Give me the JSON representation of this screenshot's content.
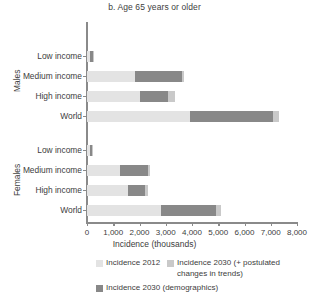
{
  "chart_data": {
    "type": "bar",
    "orientation": "horizontal",
    "stacked": true,
    "title": "b. Age 65 years or older",
    "xlabel": "Incidence (thousands)",
    "ylabel": "",
    "xlim": [
      0,
      8000
    ],
    "xticks": [
      0,
      1000,
      2000,
      3000,
      4000,
      5000,
      6000,
      7000,
      8000
    ],
    "xtick_labels": [
      "0",
      "1,000",
      "2,000",
      "3,000",
      "4,000",
      "5,000",
      "6,000",
      "7,000",
      "8,000"
    ],
    "grid": false,
    "legend_position": "bottom",
    "groups": [
      {
        "name": "Males",
        "categories": [
          "Low income",
          "Medium income",
          "High income",
          "World"
        ]
      },
      {
        "name": "Females",
        "categories": [
          "Low income",
          "Medium income",
          "High income",
          "World"
        ]
      }
    ],
    "series": [
      {
        "name": "Incidence 2012",
        "color": "#e3e3e3",
        "values": [
          120,
          1830,
          2020,
          3930,
          100,
          1250,
          1560,
          2810
        ]
      },
      {
        "name": "Incidence 2030 (demographics)",
        "color": "#888888",
        "values": [
          110,
          1800,
          1060,
          3140,
          80,
          1060,
          650,
          2090
        ]
      },
      {
        "name": "Incidence 2030 (+ postulated changes in trends)",
        "color": "#c9c9c9",
        "values": [
          20,
          60,
          280,
          230,
          15,
          90,
          130,
          190
        ]
      }
    ],
    "bars": [
      {
        "group": "Males",
        "category": "Low income",
        "incidence_2012": 120,
        "incidence_2030_demographics": 110,
        "incidence_2030_postulated": 20,
        "total": 250
      },
      {
        "group": "Males",
        "category": "Medium income",
        "incidence_2012": 1830,
        "incidence_2030_demographics": 1800,
        "incidence_2030_postulated": 60,
        "total": 3690
      },
      {
        "group": "Males",
        "category": "High income",
        "incidence_2012": 2020,
        "incidence_2030_demographics": 1060,
        "incidence_2030_postulated": 280,
        "total": 3360
      },
      {
        "group": "Males",
        "category": "World",
        "incidence_2012": 3930,
        "incidence_2030_demographics": 3140,
        "incidence_2030_postulated": 230,
        "total": 7300
      },
      {
        "group": "Females",
        "category": "Low income",
        "incidence_2012": 100,
        "incidence_2030_demographics": 80,
        "incidence_2030_postulated": 15,
        "total": 195
      },
      {
        "group": "Females",
        "category": "Medium income",
        "incidence_2012": 1250,
        "incidence_2030_demographics": 1060,
        "incidence_2030_postulated": 90,
        "total": 2400
      },
      {
        "group": "Females",
        "category": "High income",
        "incidence_2012": 1560,
        "incidence_2030_demographics": 650,
        "incidence_2030_postulated": 130,
        "total": 2340
      },
      {
        "group": "Females",
        "category": "World",
        "incidence_2012": 2810,
        "incidence_2030_demographics": 2090,
        "incidence_2030_postulated": 190,
        "total": 5090
      }
    ]
  },
  "title": "b. Age 65 years or older",
  "axes": {
    "x_title": "Incidence (thousands)",
    "tick_labels": [
      "0",
      "1,000",
      "2,000",
      "3,000",
      "4,000",
      "5,000",
      "6,000",
      "7,000",
      "8,000"
    ]
  },
  "groups": {
    "males": "Males",
    "females": "Females"
  },
  "categories": {
    "low": "Low income",
    "medium": "Medium income",
    "high": "High income",
    "world": "World"
  },
  "legend": {
    "item_2012": "Incidence 2012",
    "item_2030_postulated": "Incidence 2030 (+ postulated\nchanges in trends)",
    "item_2030_demographics": "Incidence 2030 (demographics)"
  },
  "colors": {
    "incidence_2012": "#e3e3e3",
    "incidence_2030_demographics": "#888888",
    "incidence_2030_postulated": "#c9c9c9",
    "axis": "#8a8a8a",
    "text": "#3d3d3d"
  }
}
